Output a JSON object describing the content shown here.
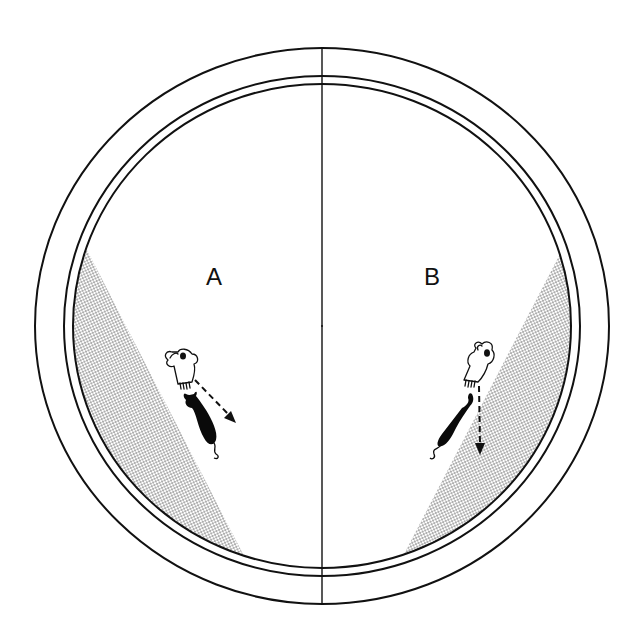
{
  "diagram": {
    "type": "arena-apparatus",
    "colors": {
      "background": "#ffffff",
      "line": "#111111",
      "stipple": "#333333",
      "figure": "#0a0a0a"
    },
    "regions": [
      {
        "id": "A",
        "label": "A",
        "side": "left",
        "shaded_wedge": "left-lower",
        "arrow_direction": "down-right"
      },
      {
        "id": "B",
        "label": "B",
        "side": "right",
        "shaded_wedge": "right-lower",
        "arrow_direction": "down"
      }
    ],
    "elements": {
      "rings": [
        "outer-wall",
        "middle-wall",
        "inner-wall"
      ],
      "divider": "vertical-center-line",
      "figures": [
        "hand-releasing-animal",
        "animal-silhouette",
        "dashed-direction-arrow"
      ]
    }
  }
}
